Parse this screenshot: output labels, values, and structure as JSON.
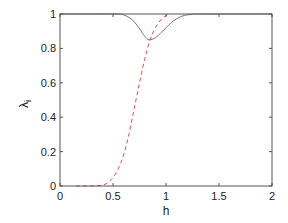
{
  "chart_data": {
    "type": "line",
    "title": "",
    "xlabel": "h",
    "ylabel": "λ",
    "ylabel_subscript": "i",
    "xlim": [
      0,
      2
    ],
    "ylim": [
      0,
      1
    ],
    "grid": false,
    "legend": null,
    "xticks": [
      "0",
      "0.5",
      "1",
      "1.5",
      "2"
    ],
    "yticks": [
      "0",
      "0.2",
      "0.4",
      "0.6",
      "0.8",
      "1"
    ],
    "series": [
      {
        "name": "solid",
        "style": "solid",
        "color": "#6a6fa8",
        "x": [
          0,
          0.3,
          0.55,
          0.6,
          0.65,
          0.7,
          0.75,
          0.8,
          0.84,
          0.9,
          0.95,
          1.0,
          1.05,
          1.1,
          1.15,
          1.2,
          1.25,
          1.3,
          1.5,
          2.0
        ],
        "y": [
          1,
          1,
          1,
          0.995,
          0.98,
          0.955,
          0.915,
          0.87,
          0.85,
          0.862,
          0.89,
          0.92,
          0.95,
          0.972,
          0.987,
          0.995,
          0.999,
          1,
          1,
          1
        ]
      },
      {
        "name": "dashed",
        "style": "dashed",
        "color": "#e05050",
        "x": [
          0.15,
          0.3,
          0.4,
          0.45,
          0.5,
          0.55,
          0.6,
          0.65,
          0.7,
          0.75,
          0.8,
          0.85,
          0.9,
          0.95,
          1.0,
          1.03
        ],
        "y": [
          0,
          0,
          0.005,
          0.02,
          0.05,
          0.1,
          0.18,
          0.3,
          0.45,
          0.6,
          0.74,
          0.85,
          0.92,
          0.965,
          0.99,
          1
        ]
      }
    ]
  }
}
